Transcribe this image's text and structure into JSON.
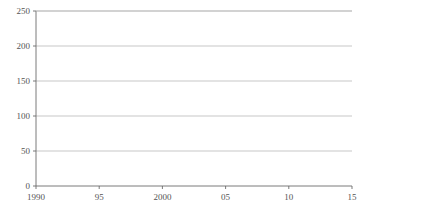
{
  "chart_data": {
    "type": "line",
    "title": "",
    "subtitle": "",
    "xlabel": "(年度)",
    "ylabel": "",
    "grid": true,
    "legend_position": "right",
    "xlim": [
      1990,
      2015
    ],
    "ylim": [
      0,
      250
    ],
    "yticks": [
      0,
      50,
      100,
      150,
      200,
      250
    ],
    "ytick_labels": [
      "0",
      "50",
      "100",
      "150",
      "200",
      "250"
    ],
    "x": [
      1990,
      1991,
      1992,
      1993,
      1994,
      1995,
      1996,
      1997,
      1998,
      1999,
      2000,
      2001,
      2002,
      2003,
      2004,
      2005,
      2006,
      2007,
      2008,
      2009,
      2010,
      2011,
      2012,
      2013,
      2014,
      2015
    ],
    "xticks": [
      1990,
      1995,
      2000,
      2005,
      2010,
      2015
    ],
    "xtick_labels": [
      "1990",
      "95",
      "2000",
      "05",
      "10",
      "15"
    ],
    "series": [
      {
        "name": "人件費",
        "marker": "open-circle",
        "line": "dashed",
        "color": "#333333",
        "values": [
          16,
          16,
          16,
          16,
          16,
          16,
          17,
          17,
          17,
          17,
          17,
          17,
          17,
          17,
          17,
          17,
          17,
          17,
          17,
          17,
          17,
          17,
          17,
          17,
          17,
          17
        ]
      },
      {
        "name": "物件費",
        "marker": "open-diamond",
        "line": "solid",
        "color": "#333333",
        "values": [
          8,
          8,
          8,
          9,
          9,
          9,
          9,
          9,
          9,
          9,
          9,
          9,
          9,
          9,
          9,
          9,
          9,
          9,
          9,
          10,
          10,
          10,
          10,
          10,
          10,
          10
        ]
      },
      {
        "name": "扶助費",
        "marker": "filled-square",
        "line": "dashed",
        "color": "#222222",
        "values": [
          53,
          57,
          63,
          63,
          64,
          66,
          69,
          74,
          79,
          83,
          91,
          97,
          102,
          112,
          120,
          123,
          137,
          142,
          144,
          147,
          200,
          206,
          197,
          201,
          209,
          215
        ]
      },
      {
        "name": "補助費等",
        "marker": "filled-triangle",
        "line": "solid",
        "color": "#222222",
        "values": [
          3,
          3,
          3,
          4,
          4,
          4,
          5,
          5,
          5,
          5,
          6,
          6,
          6,
          6,
          6,
          6,
          7,
          7,
          7,
          7,
          7,
          7,
          7,
          7,
          7,
          7
        ]
      }
    ]
  },
  "legend": {
    "items": [
      {
        "label": "人件費"
      },
      {
        "label": "物件費"
      },
      {
        "label": "扶助費"
      },
      {
        "label": "補助費等"
      }
    ]
  },
  "axis": {
    "x_unit_label": "(年度)"
  }
}
